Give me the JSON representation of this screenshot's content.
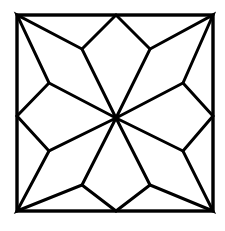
{
  "diagram": {
    "colors": {
      "background": "#ffffff",
      "stroke": "#000000"
    },
    "frame": {
      "x1": 17,
      "y1": 15,
      "x2": 213,
      "y2": 211
    },
    "center": {
      "x": 116,
      "y": 118
    },
    "petal_count": 8
  }
}
